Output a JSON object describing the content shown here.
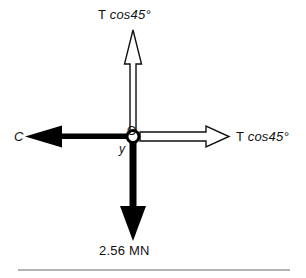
{
  "diagram": {
    "origin": {
      "point_label": "O",
      "axis_label": "y",
      "x": 133,
      "y": 136
    },
    "colors": {
      "stroke": "#111111",
      "fill_solid": "#000000",
      "fill_hollow": "#ffffff",
      "background": "#ffffff",
      "rule": "#9a9a9a"
    },
    "forces": [
      {
        "id": "force-up",
        "direction": "up",
        "style": "outline",
        "label_prefix": "T ",
        "label_expr": "cos45°",
        "label": "T cos45°"
      },
      {
        "id": "force-right",
        "direction": "right",
        "style": "outline",
        "label_prefix": "T ",
        "label_expr": "cos45°",
        "label": "T cos45°"
      },
      {
        "id": "force-left",
        "direction": "left",
        "style": "solid",
        "label_prefix": "",
        "label_expr": "C",
        "label": "C"
      },
      {
        "id": "force-down",
        "direction": "down",
        "style": "solid",
        "label_prefix": "",
        "label_expr": "2.56 MN",
        "label": "2.56 MN"
      }
    ],
    "footer_rule": {
      "name": "horizontal-rule",
      "x1": 18,
      "x2": 290,
      "y": 270
    }
  }
}
